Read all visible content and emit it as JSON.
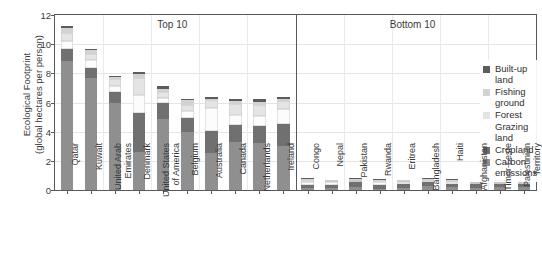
{
  "chart_data": {
    "type": "bar",
    "stacked": true,
    "title": "",
    "xlabel": "",
    "ylabel": "Ecological Footprint (global hectares per person)",
    "ylabel_line1": "Ecological Footprint",
    "ylabel_line2": "(global hectares per person)",
    "ylim": [
      0,
      12
    ],
    "yticks": [
      0,
      2,
      4,
      6,
      8,
      10,
      12
    ],
    "ytick_labels": [
      "0",
      "2",
      "4",
      "6",
      "8",
      "10",
      "12"
    ],
    "grid": true,
    "legend_position": "upper right",
    "panel_labels": [
      "Top 10",
      "Bottom 10"
    ],
    "series_order_bottom_to_top": [
      "Carbon emissions",
      "Cropland",
      "Grazing land",
      "Forest",
      "Fishing ground",
      "Built-up land"
    ],
    "series": [
      {
        "name": "Carbon emissions",
        "color": "#8f8f8f",
        "values": [
          8.85,
          7.65,
          5.95,
          2.6,
          4.9,
          3.95,
          2.55,
          3.3,
          3.2,
          3.05,
          0.12,
          0.14,
          0.22,
          0.1,
          0.16,
          0.26,
          0.18,
          0.16,
          0.2,
          0.2
        ]
      },
      {
        "name": "Cropland",
        "color": "#707070",
        "values": [
          0.8,
          0.75,
          0.75,
          2.7,
          1.1,
          1.0,
          1.5,
          1.15,
          1.2,
          1.45,
          0.22,
          0.22,
          0.3,
          0.26,
          0.24,
          0.26,
          0.24,
          0.22,
          0.18,
          0.18
        ]
      },
      {
        "name": "Grazing land",
        "color": "#fcfcfc",
        "values": [
          0.55,
          0.5,
          0.45,
          1.2,
          0.3,
          0.45,
          1.6,
          0.7,
          0.7,
          1.05,
          0.22,
          0.16,
          0.1,
          0.18,
          0.12,
          0.06,
          0.14,
          0.08,
          0.12,
          0.08
        ]
      },
      {
        "name": "Forest",
        "color": "#e4e4e4",
        "values": [
          0.55,
          0.45,
          0.45,
          1.15,
          0.4,
          0.45,
          0.5,
          0.75,
          0.7,
          0.55,
          0.16,
          0.12,
          0.1,
          0.12,
          0.1,
          0.1,
          0.1,
          0.06,
          0.08,
          0.06
        ]
      },
      {
        "name": "Fishing ground",
        "color": "#d2d2d2",
        "values": [
          0.35,
          0.25,
          0.15,
          0.3,
          0.25,
          0.3,
          0.1,
          0.2,
          0.25,
          0.15,
          0.04,
          0.04,
          0.04,
          0.04,
          0.04,
          0.08,
          0.04,
          0.03,
          0.04,
          0.03
        ]
      },
      {
        "name": "Built-up land",
        "color": "#5c5c5c",
        "values": [
          0.15,
          0.1,
          0.1,
          0.15,
          0.15,
          0.1,
          0.1,
          0.15,
          0.2,
          0.15,
          0.04,
          0.04,
          0.04,
          0.04,
          0.04,
          0.04,
          0.04,
          0.03,
          0.04,
          0.03
        ]
      }
    ],
    "categories": [
      "Qatar",
      "Kuwait",
      "United Arab\nEmirates",
      "Denmark",
      "United States\nof America",
      "Belgium",
      "Australia",
      "Canada",
      "Netherlands",
      "Ireland",
      "Congo",
      "Nepal",
      "Pakistan",
      "Rwanda",
      "Eritrea",
      "Bangladesh",
      "Haiti",
      "Afghanistan",
      "Timor-Leste",
      "Palestinian\nTerritory"
    ],
    "totals": [
      11.25,
      9.7,
      7.85,
      8.1,
      7.1,
      6.25,
      6.35,
      6.25,
      6.25,
      6.4,
      0.8,
      0.72,
      0.8,
      0.74,
      0.7,
      0.8,
      0.74,
      0.58,
      0.66,
      0.58
    ]
  },
  "legend": {
    "items": [
      {
        "label": "Built-up land",
        "color": "#5c5c5c"
      },
      {
        "label": "Fishing ground",
        "color": "#d2d2d2"
      },
      {
        "label": "Forest",
        "color": "#e4e4e4"
      },
      {
        "label": "Grazing land",
        "color": "#fcfcfc"
      },
      {
        "label": "Cropland",
        "color": "#707070"
      },
      {
        "label": "Carbon\nemissions",
        "color": "#8f8f8f"
      }
    ]
  },
  "panels": {
    "top": "Top 10",
    "bottom": "Bottom 10"
  }
}
